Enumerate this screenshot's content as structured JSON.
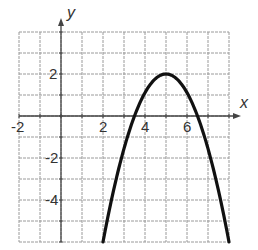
{
  "chart_data": {
    "type": "line",
    "title": "",
    "xlabel": "x",
    "ylabel": "y",
    "xlim": [
      -2,
      8
    ],
    "ylim": [
      -6,
      4
    ],
    "grid": true,
    "grid_step": 1,
    "x_tick_labels": [
      "-2",
      "2",
      "4",
      "6"
    ],
    "y_tick_labels": [
      "2",
      "-2",
      "-4"
    ],
    "series": [
      {
        "name": "parabola",
        "equation": "y = -(8/9)(x - 5)^2 + 2",
        "vertex": [
          5,
          2
        ],
        "x": [
          2,
          2.5,
          3,
          3.5,
          4,
          4.5,
          5,
          5.5,
          6,
          6.5,
          7,
          7.5,
          8
        ],
        "y": [
          -6,
          -3.56,
          -1.56,
          0,
          1.11,
          1.78,
          2,
          1.78,
          1.11,
          0,
          -1.56,
          -3.56,
          -6
        ]
      }
    ],
    "legend": null
  },
  "labels": {
    "x_axis": "x",
    "y_axis": "y",
    "x_ticks": [
      {
        "value": -2,
        "text": "-2"
      },
      {
        "value": 2,
        "text": "2"
      },
      {
        "value": 4,
        "text": "4"
      },
      {
        "value": 6,
        "text": "6"
      }
    ],
    "y_ticks": [
      {
        "value": 2,
        "text": "2"
      },
      {
        "value": -2,
        "text": "-2"
      },
      {
        "value": -4,
        "text": "-4"
      }
    ]
  }
}
